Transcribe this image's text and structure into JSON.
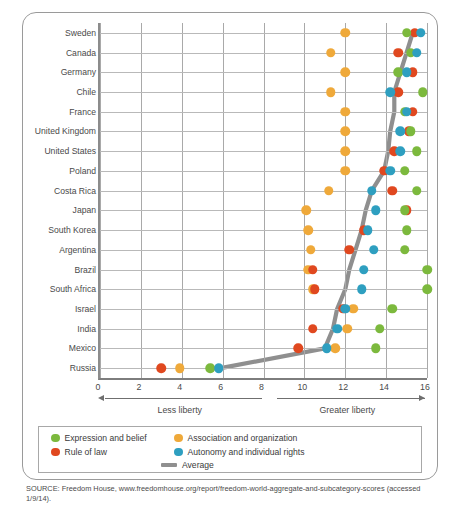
{
  "chart_data": {
    "type": "scatter",
    "title": "",
    "xlabel": "",
    "ylabel": "",
    "xlim": [
      0,
      16
    ],
    "xticks": [
      0,
      2,
      4,
      6,
      8,
      10,
      12,
      14,
      16
    ],
    "grid": true,
    "legend_position": "bottom",
    "axis_notes": [
      {
        "text": "Less liberty",
        "from": 0,
        "to": 8,
        "direction": "left"
      },
      {
        "text": "Greater liberty",
        "from": 8.4,
        "to": 16,
        "direction": "right"
      }
    ],
    "categories": [
      "Sweden",
      "Canada",
      "Germany",
      "Chile",
      "France",
      "United Kingdom",
      "United States",
      "Poland",
      "Costa Rica",
      "Japan",
      "South Korea",
      "Argentina",
      "Brazil",
      "South Africa",
      "Israel",
      "India",
      "Mexico",
      "Russia"
    ],
    "series": [
      {
        "name": "Expression and belief",
        "color": "#7cb93d",
        "values": [
          15.0,
          15.2,
          14.6,
          15.8,
          14.9,
          15.2,
          15.5,
          14.9,
          15.5,
          14.9,
          15.0,
          14.9,
          16.0,
          16.0,
          14.3,
          13.7,
          13.5,
          5.4
        ]
      },
      {
        "name": "Rule of law",
        "color": "#e0481f",
        "values": [
          15.4,
          14.6,
          15.3,
          14.6,
          15.3,
          15.1,
          14.4,
          13.9,
          14.3,
          15.0,
          12.9,
          12.2,
          10.4,
          10.5,
          11.9,
          10.4,
          9.7,
          3.0
        ]
      },
      {
        "name": "Association and organization",
        "color": "#efa93a",
        "values": [
          12.0,
          11.3,
          12.0,
          11.3,
          12.0,
          12.0,
          12.0,
          12.0,
          11.2,
          10.1,
          10.2,
          10.3,
          10.2,
          10.4,
          12.4,
          12.1,
          11.5,
          3.9
        ]
      },
      {
        "name": "Autonomy and individual rights",
        "color": "#2e9fc0",
        "values": [
          15.7,
          15.5,
          15.0,
          14.2,
          15.0,
          14.7,
          14.7,
          14.2,
          13.3,
          13.5,
          13.1,
          13.4,
          12.9,
          12.8,
          12.0,
          11.6,
          11.1,
          5.8
        ]
      }
    ],
    "average": {
      "name": "Average",
      "color": "#8f8f8f",
      "values": [
        15.3,
        15.0,
        14.7,
        14.4,
        14.4,
        14.2,
        14.1,
        13.9,
        13.3,
        13.0,
        12.8,
        12.5,
        12.2,
        12.0,
        11.6,
        11.4,
        11.0,
        5.9
      ]
    }
  },
  "legend": {
    "items": [
      {
        "label": "Expression and belief",
        "color": "#7cb93d",
        "shape": "dot"
      },
      {
        "label": "Association and organization",
        "color": "#efa93a",
        "shape": "dot"
      },
      {
        "label": "Rule of law",
        "color": "#e0481f",
        "shape": "dot"
      },
      {
        "label": "Autonomy and individual rights",
        "color": "#2e9fc0",
        "shape": "dot"
      },
      {
        "label": "Average",
        "color": "#8f8f8f",
        "shape": "bar"
      }
    ]
  },
  "source": {
    "line1": "SOURCE: Freedom House, www.freedomhouse.org/report/freedom-world-aggregate-and-subcategory-scores",
    "line2": "(accessed 1/9/14)."
  }
}
